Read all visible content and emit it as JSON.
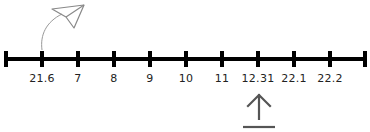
{
  "number_line": {
    "ticks": [
      {
        "x": 6,
        "label": ""
      },
      {
        "x": 42,
        "label": "21.6"
      },
      {
        "x": 78,
        "label": "7"
      },
      {
        "x": 114,
        "label": "8"
      },
      {
        "x": 150,
        "label": "9"
      },
      {
        "x": 186,
        "label": "10"
      },
      {
        "x": 222,
        "label": "11"
      },
      {
        "x": 258,
        "label": "12.31"
      },
      {
        "x": 294,
        "label": "22.1"
      },
      {
        "x": 330,
        "label": "22.2"
      },
      {
        "x": 365,
        "label": ""
      }
    ]
  },
  "icons": {
    "plane": "paper-plane-icon",
    "upload": "upload-arrow-icon"
  },
  "colors": {
    "line": "#000000",
    "icon": "#555555",
    "plane": "#888888"
  }
}
